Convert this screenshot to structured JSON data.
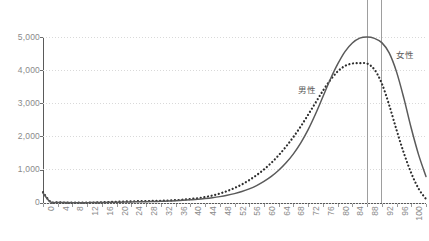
{
  "chart_data": {
    "type": "line",
    "title": "",
    "subtitle": "",
    "xlabel": "",
    "ylabel": "",
    "xlim": [
      0,
      104
    ],
    "ylim": [
      0,
      5000
    ],
    "grid": true,
    "legend_position": "inline-annotation",
    "y_ticks": [
      "0",
      "1,000",
      "2,000",
      "3,000",
      "4,000",
      "5,000"
    ],
    "y_tick_values": [
      0,
      1000,
      2000,
      3000,
      4000,
      5000
    ],
    "x_ticks": [
      "0",
      "4",
      "8",
      "12",
      "16",
      "20",
      "24",
      "28",
      "32",
      "36",
      "40",
      "44",
      "48",
      "52",
      "56",
      "60",
      "64",
      "68",
      "72",
      "76",
      "80",
      "84",
      "88",
      "92",
      "96",
      "100",
      "104"
    ],
    "x_tick_values": [
      0,
      4,
      8,
      12,
      16,
      20,
      24,
      28,
      32,
      36,
      40,
      44,
      48,
      52,
      56,
      60,
      64,
      68,
      72,
      76,
      80,
      84,
      88,
      92,
      96,
      100,
      104
    ],
    "annotations": [
      {
        "text": "男性",
        "x": 78,
        "y": 2900
      },
      {
        "text": "女性",
        "x": 98,
        "y": 4350
      }
    ],
    "reference_lines": [
      {
        "x": 88,
        "label": "",
        "color": "#9e9e9e"
      },
      {
        "x": 92,
        "label": "",
        "color": "#9e9e9e"
      }
    ],
    "series": [
      {
        "name": "男性",
        "style": "dotted",
        "color": "#2e2e2e",
        "peak_x": 88,
        "peak_y": 4200,
        "x": [
          0,
          2,
          4,
          6,
          8,
          10,
          12,
          14,
          16,
          18,
          20,
          22,
          24,
          26,
          28,
          30,
          32,
          34,
          36,
          38,
          40,
          42,
          44,
          46,
          48,
          50,
          52,
          54,
          56,
          58,
          60,
          62,
          64,
          66,
          68,
          70,
          72,
          74,
          76,
          78,
          80,
          82,
          84,
          86,
          88,
          90,
          92,
          94,
          96,
          98,
          100,
          102,
          104
        ],
        "values": [
          330,
          40,
          20,
          15,
          12,
          12,
          14,
          16,
          22,
          30,
          38,
          45,
          50,
          55,
          58,
          62,
          68,
          75,
          85,
          100,
          120,
          145,
          180,
          225,
          285,
          360,
          450,
          560,
          690,
          840,
          1010,
          1210,
          1440,
          1700,
          1990,
          2310,
          2660,
          3020,
          3380,
          3700,
          3960,
          4130,
          4200,
          4210,
          4200,
          4020,
          3600,
          2950,
          2200,
          1500,
          900,
          430,
          120
        ]
      },
      {
        "name": "女性",
        "style": "solid",
        "color": "#5a5a5a",
        "peak_x": 92,
        "peak_y": 5000,
        "x": [
          0,
          2,
          4,
          6,
          8,
          10,
          12,
          14,
          16,
          18,
          20,
          22,
          24,
          26,
          28,
          30,
          32,
          34,
          36,
          38,
          40,
          42,
          44,
          46,
          48,
          50,
          52,
          54,
          56,
          58,
          60,
          62,
          64,
          66,
          68,
          70,
          72,
          74,
          76,
          78,
          80,
          82,
          84,
          86,
          88,
          90,
          92,
          94,
          96,
          98,
          100,
          102,
          104
        ],
        "values": [
          300,
          35,
          18,
          12,
          10,
          10,
          11,
          13,
          16,
          20,
          24,
          28,
          32,
          36,
          40,
          45,
          50,
          58,
          68,
          80,
          95,
          112,
          134,
          160,
          192,
          232,
          282,
          345,
          425,
          525,
          650,
          800,
          985,
          1210,
          1480,
          1810,
          2210,
          2680,
          3200,
          3720,
          4180,
          4560,
          4820,
          4965,
          5000,
          4960,
          4830,
          4520,
          3950,
          3150,
          2250,
          1450,
          800
        ]
      }
    ]
  }
}
